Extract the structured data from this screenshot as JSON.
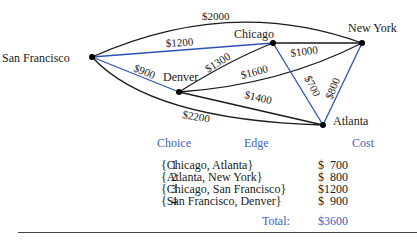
{
  "nodes": [
    {
      "id": "sf",
      "label": "San Francisco"
    },
    {
      "id": "chi",
      "label": "Chicago"
    },
    {
      "id": "ny",
      "label": "New York"
    },
    {
      "id": "den",
      "label": "Denver"
    },
    {
      "id": "atl",
      "label": "Atlanta"
    }
  ],
  "edges": [
    {
      "from": "sf",
      "to": "ny",
      "weight": "$2000",
      "in_tree": false
    },
    {
      "from": "sf",
      "to": "chi",
      "weight": "$1200",
      "in_tree": true
    },
    {
      "from": "sf",
      "to": "den",
      "weight": "$900",
      "in_tree": true
    },
    {
      "from": "sf",
      "to": "atl",
      "weight": "$2200",
      "in_tree": false
    },
    {
      "from": "den",
      "to": "chi",
      "weight": "$1300",
      "in_tree": false
    },
    {
      "from": "den",
      "to": "ny",
      "weight": "$1600",
      "in_tree": false
    },
    {
      "from": "den",
      "to": "atl",
      "weight": "$1400",
      "in_tree": false
    },
    {
      "from": "chi",
      "to": "ny",
      "weight": "$1000",
      "in_tree": false
    },
    {
      "from": "chi",
      "to": "atl",
      "weight": "$700",
      "in_tree": true
    },
    {
      "from": "ny",
      "to": "atl",
      "weight": "$800",
      "in_tree": true
    }
  ],
  "table": {
    "headers": {
      "choice": "Choice",
      "edge": "Edge",
      "cost": "Cost"
    },
    "rows": [
      {
        "choice": "1",
        "edge": "{Chicago, Atlanta}",
        "cost": "$  700"
      },
      {
        "choice": "2",
        "edge": "{Atlanta, New York}",
        "cost": "$  800"
      },
      {
        "choice": "3",
        "edge": "{Chicago, San Francisco}",
        "cost": "$1200"
      },
      {
        "choice": "4",
        "edge": "{San Francisco, Denver}",
        "cost": "$  900"
      }
    ],
    "total_label": "Total:",
    "total_value": "$3600"
  },
  "colors": {
    "tree_edge": "#2e52b8",
    "edge": "#1a1a1a",
    "header": "#3a64c0"
  }
}
